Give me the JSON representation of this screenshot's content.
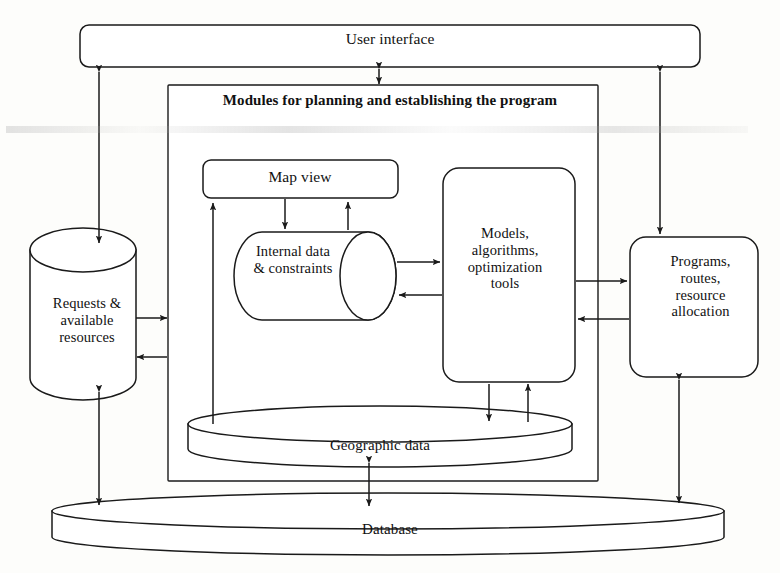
{
  "diagram": {
    "stroke_color": "#1a1a1a",
    "fill_color": "#ffffff",
    "background_color": "#fdfdfb"
  },
  "nodes": {
    "user_interface": {
      "label": "User interface",
      "shape": "rounded-rectangle"
    },
    "modules_container": {
      "label": "Modules for planning and establishing the program",
      "shape": "rectangle"
    },
    "map_view": {
      "label": "Map view",
      "shape": "rounded-rectangle"
    },
    "internal_data": {
      "label": "Internal data\n& constraints",
      "shape": "horizontal-cylinder"
    },
    "models": {
      "label": "Models,\nalgorithms,\noptimization\ntools",
      "shape": "rounded-rectangle"
    },
    "requests": {
      "label": "Requests &\navailable\nresources",
      "shape": "vertical-cylinder"
    },
    "programs": {
      "label": "Programs,\nroutes,\nresource\nallocation",
      "shape": "rounded-rectangle"
    },
    "geographic_data": {
      "label": "Geographic data",
      "shape": "flat-disk-cylinder"
    },
    "database": {
      "label": "Database",
      "shape": "flat-disk-cylinder"
    }
  },
  "edges": [
    {
      "name": "ui-to-requests",
      "from": "user_interface",
      "to": "requests",
      "direction": "bidirectional"
    },
    {
      "name": "ui-to-modules",
      "from": "user_interface",
      "to": "modules_container",
      "direction": "bidirectional"
    },
    {
      "name": "ui-to-programs",
      "from": "user_interface",
      "to": "programs",
      "direction": "bidirectional"
    },
    {
      "name": "requests-to-modules",
      "from": "requests",
      "to": "modules_container",
      "direction": "forward"
    },
    {
      "name": "modules-to-requests",
      "from": "modules_container",
      "to": "requests",
      "direction": "forward"
    },
    {
      "name": "geographic-to-mapview",
      "from": "geographic_data",
      "to": "map_view",
      "direction": "forward"
    },
    {
      "name": "mapview-to-internal",
      "from": "map_view",
      "to": "internal_data",
      "direction": "forward"
    },
    {
      "name": "internal-to-mapview",
      "from": "internal_data",
      "to": "map_view",
      "direction": "forward"
    },
    {
      "name": "internal-to-models",
      "from": "internal_data",
      "to": "models",
      "direction": "forward"
    },
    {
      "name": "models-to-internal",
      "from": "models",
      "to": "internal_data",
      "direction": "forward"
    },
    {
      "name": "models-to-programs",
      "from": "models",
      "to": "programs",
      "direction": "forward"
    },
    {
      "name": "programs-to-models",
      "from": "programs",
      "to": "models",
      "direction": "forward"
    },
    {
      "name": "models-to-geographic",
      "from": "models",
      "to": "geographic_data",
      "direction": "forward"
    },
    {
      "name": "geographic-to-models",
      "from": "geographic_data",
      "to": "models",
      "direction": "forward"
    },
    {
      "name": "geographic-to-database",
      "from": "geographic_data",
      "to": "database",
      "direction": "bidirectional"
    },
    {
      "name": "requests-to-database",
      "from": "requests",
      "to": "database",
      "direction": "bidirectional"
    },
    {
      "name": "programs-to-database",
      "from": "programs",
      "to": "database",
      "direction": "bidirectional"
    }
  ]
}
